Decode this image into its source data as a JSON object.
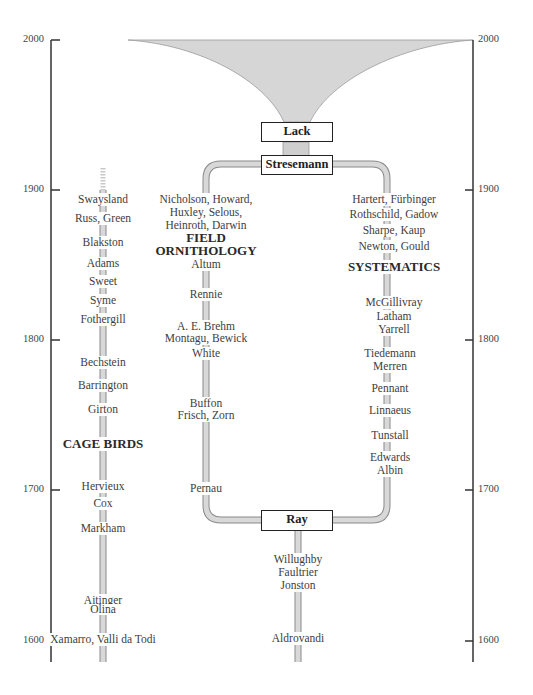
{
  "axis": {
    "years": [
      "2000",
      "1900",
      "1800",
      "1700",
      "1600"
    ]
  },
  "nodes": {
    "lack": "Lack",
    "stresemann": "Stresemann",
    "ray": "Ray"
  },
  "cage_birds": {
    "heading": "CAGE BIRDS",
    "names": [
      "Swaysland",
      "Russ, Green",
      "Blakston",
      "Adams",
      "Sweet",
      "Syme",
      "Fothergill",
      "Bechstein",
      "Barrington",
      "Girton",
      "Hervieux",
      "Cox",
      "Markham",
      "Aitinger",
      "Olina",
      "Xamarro, Valli da Todi"
    ]
  },
  "field_ornithology": {
    "heading_line1": "FIELD",
    "heading_line2": "ORNITHOLOGY",
    "names": [
      "Nicholson, Howard,",
      "Huxley, Selous,",
      "Heinroth, Darwin",
      "Altum",
      "Rennie",
      "A. E. Brehm",
      "Montagu, Bewick",
      "White",
      "Buffon",
      "Frisch, Zorn",
      "Pernau"
    ]
  },
  "systematics": {
    "heading": "SYSTEMATICS",
    "names": [
      "Hartert, Fürbinger",
      "Rothschild, Gadow",
      "Sharpe, Kaup",
      "Newton, Gould",
      "McGillivray",
      "Latham",
      "Yarrell",
      "Tiedemann",
      "Merren",
      "Pennant",
      "Linnaeus",
      "Tunstall",
      "Edwards",
      "Albin"
    ]
  },
  "early": {
    "names": [
      "Willughby",
      "Faultrier",
      "Jonston",
      "Aldrovandi"
    ]
  },
  "colors": {
    "pipe_fill": "#cfcfcf",
    "pipe_edge": "#8a8a8a",
    "funnel": "#d4d4d4",
    "axis": "#333333"
  }
}
